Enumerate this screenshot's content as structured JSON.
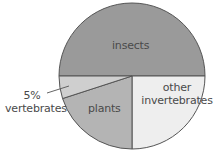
{
  "chart_data": {
    "type": "pie",
    "title": "",
    "start_angle_deg": 180,
    "direction": "clockwise-from-left",
    "slices": [
      {
        "label": "insects",
        "value": 50,
        "color": "#9a9a9a"
      },
      {
        "label": "other invertebrates",
        "value": 25,
        "color": "#eeeeee"
      },
      {
        "label": "plants",
        "value": 20,
        "color": "#b4b4b4"
      },
      {
        "label": "vertebrates",
        "value": 5,
        "color": "#cfcfcf"
      }
    ],
    "annotations": [
      {
        "text": "5%",
        "target": "vertebrates"
      }
    ]
  },
  "labels": {
    "insects": "insects",
    "other_line1": "other",
    "other_line2": "invertebrates",
    "plants": "plants",
    "vert_pct": "5%",
    "vert_name": "vertebrates"
  },
  "style": {
    "edge_color": "#555555",
    "text_color": "#4a4a4a"
  }
}
